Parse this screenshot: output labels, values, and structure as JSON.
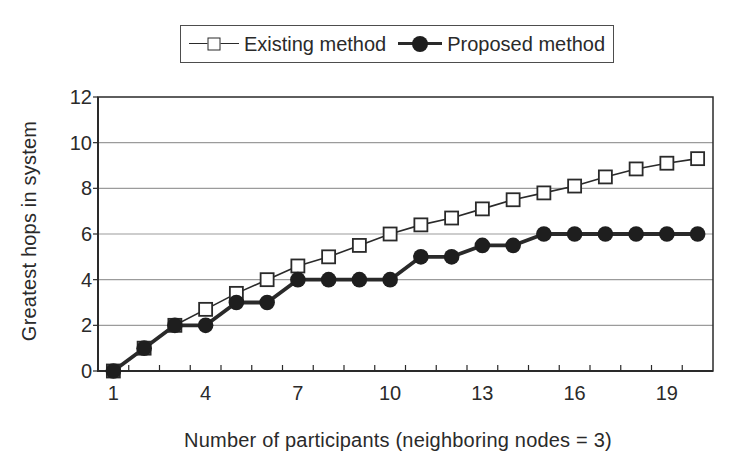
{
  "chart_data": {
    "type": "line",
    "title": "",
    "xlabel": "Number of participants (neighboring nodes = 3)",
    "ylabel": "Greatest hops in system",
    "x": [
      1,
      2,
      3,
      4,
      5,
      6,
      7,
      8,
      9,
      10,
      11,
      12,
      13,
      14,
      15,
      16,
      17,
      18,
      19,
      20
    ],
    "series": [
      {
        "name": "Existing method",
        "marker": "open-square",
        "line_width": "thin",
        "values": [
          0,
          1,
          2,
          2.7,
          3.4,
          4,
          4.6,
          5,
          5.5,
          6,
          6.4,
          6.7,
          7.1,
          7.5,
          7.8,
          8.1,
          8.5,
          8.85,
          9.1,
          9.3
        ]
      },
      {
        "name": "Proposed method",
        "marker": "filled-circle",
        "line_width": "thick",
        "values": [
          0,
          1,
          2,
          2,
          3,
          3,
          4,
          4,
          4,
          4,
          5,
          5,
          5.5,
          5.5,
          6,
          6,
          6,
          6,
          6,
          6
        ]
      }
    ],
    "ylim": [
      0,
      12
    ],
    "y_ticks": [
      0,
      2,
      4,
      6,
      8,
      10,
      12
    ],
    "x_tick_labels": [
      1,
      4,
      7,
      10,
      13,
      16,
      19
    ],
    "grid": "horizontal-only",
    "legend_position": "top-center",
    "colors": {
      "foreground": "#2a2a2a",
      "gridline": "#9b9b9b",
      "background": "#ffffff",
      "legend_border": "#4d4d4d"
    }
  }
}
